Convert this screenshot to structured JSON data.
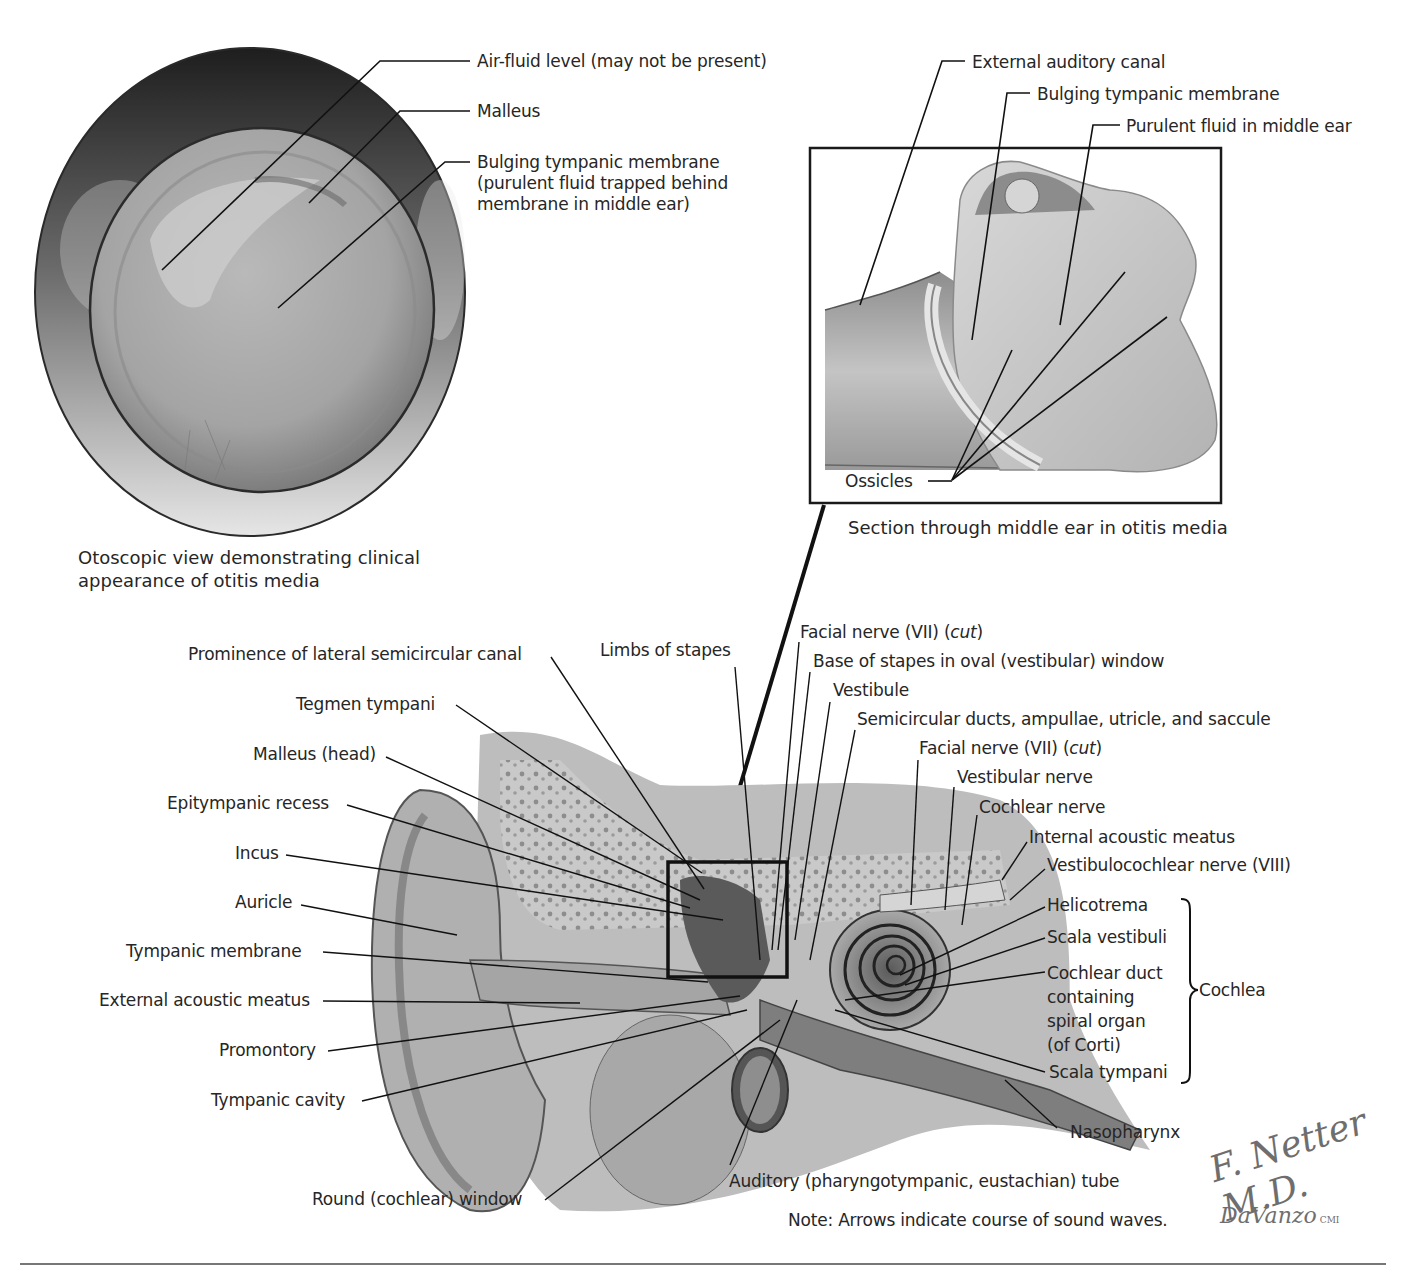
{
  "figure": {
    "otoscopic_view": {
      "caption": "Otoscopic view demonstrating clinical appearance of otitis media",
      "labels": [
        "Air-fluid level (may not be present)",
        "Malleus",
        "Bulging tympanic membrane (purulent fluid trapped behind membrane in middle ear)"
      ]
    },
    "middle_ear_section": {
      "caption": "Section through middle ear in otitis media",
      "labels": [
        "External auditory canal",
        "Bulging tympanic membrane",
        "Purulent fluid in middle ear",
        "Ossicles"
      ]
    },
    "ear_anatomy": {
      "left_labels": [
        "Prominence of lateral semicircular canal",
        "Tegmen tympani",
        "Malleus (head)",
        "Epitympanic recess",
        "Incus",
        "Auricle",
        "Tympanic membrane",
        "External acoustic meatus",
        "Promontory",
        "Tympanic cavity",
        "Round (cochlear) window"
      ],
      "top_labels": [
        "Limbs of stapes",
        "Facial nerve (VII)",
        "Base of stapes in oval (vestibular) window",
        "Vestibule",
        "Semicircular ducts, ampullae, utricle, and saccule",
        "Facial nerve (VII)",
        "Vestibular nerve",
        "Cochlear nerve",
        "Internal acoustic meatus",
        "Vestibulocochlear nerve (VIII)"
      ],
      "cut_note": "cut",
      "cochlea_labels": [
        "Helicotrema",
        "Scala vestibuli",
        "Cochlear duct containing spiral organ (of Corti)",
        "Scala tympani"
      ],
      "cochlea_group": "Cochlea",
      "bottom_labels": [
        "Nasopharynx",
        "Auditory (pharyngotympanic, eustachian) tube"
      ],
      "note": "Note: Arrows indicate course of sound waves."
    },
    "signatures": {
      "primary": "F. Netter M.D.",
      "secondary": "DaVanzo",
      "secondary_suffix": "CMI"
    }
  }
}
